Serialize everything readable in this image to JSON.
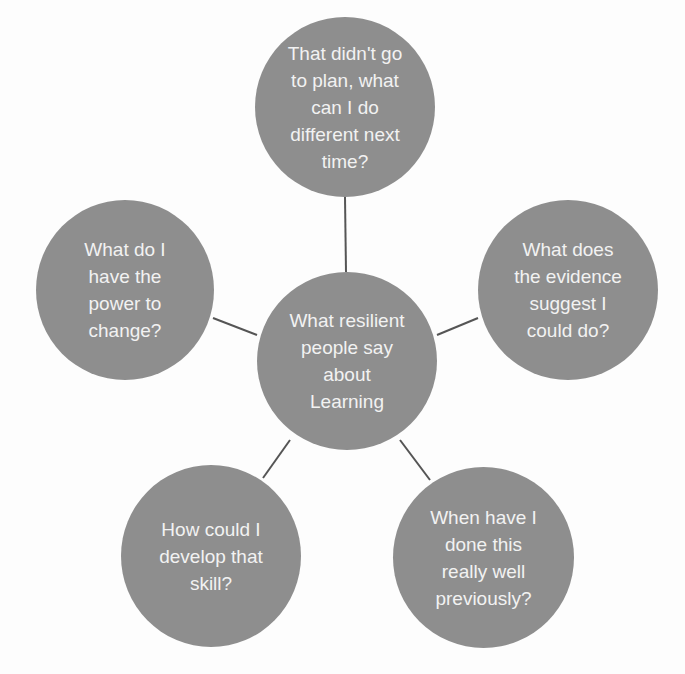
{
  "diagram": {
    "type": "hub-and-spoke",
    "colors": {
      "node_fill": "#8e8e8e",
      "node_text": "#f2f2f2",
      "connector": "#555555",
      "background": "#fdfdfd"
    },
    "center": {
      "label": "What resilient\npeople say\nabout\nLearning"
    },
    "spokes": [
      {
        "id": "top",
        "label": "That didn't go\nto plan, what\ncan I do\ndifferent next\ntime?"
      },
      {
        "id": "right",
        "label": "What does\nthe evidence\nsuggest I\ncould do?"
      },
      {
        "id": "bottom-right",
        "label": "When have I\ndone this\nreally well\npreviously?"
      },
      {
        "id": "bottom-left",
        "label": "How could I\ndevelop that\nskill?"
      },
      {
        "id": "left",
        "label": "What do I\nhave the\npower to\nchange?"
      }
    ]
  }
}
